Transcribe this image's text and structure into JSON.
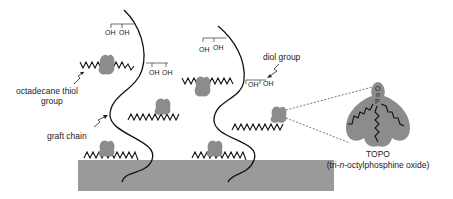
{
  "figure": {
    "colors": {
      "substrate": "#9a9a9a",
      "topo_blob": "#8c8c8c",
      "line": "#111111",
      "text": "#222222"
    },
    "labels": {
      "octadecane_line1": "octadecane thiol",
      "octadecane_line2": "group",
      "graft_chain": "graft chain",
      "diol_group": "diol group",
      "topo_name": "TOPO",
      "topo_full_prefix": "(tri-",
      "topo_full_italic": "n",
      "topo_full_suffix": "-octylphosphine oxide)"
    },
    "oh_groups": [
      {
        "id": "oh-1",
        "a": "OH",
        "b": "OH"
      },
      {
        "id": "oh-2",
        "a": "OH",
        "b": "OH"
      },
      {
        "id": "oh-3",
        "a": "OH",
        "b": "OH"
      },
      {
        "id": "oh-4",
        "a": "OH",
        "b": "OH"
      }
    ],
    "topo_atoms": {
      "oxygen": "O",
      "phosphorus": "P"
    }
  }
}
